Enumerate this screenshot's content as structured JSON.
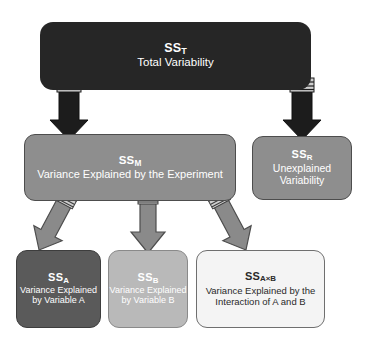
{
  "diagram": {
    "background_color": "#ffffff",
    "nodes": {
      "total": {
        "symbol": "SS",
        "subscript": "T",
        "label": "Total Variability",
        "fill_color": "#262626",
        "text_color": "#ffffff"
      },
      "model": {
        "symbol": "SS",
        "subscript": "M",
        "label": "Variance Explained by the Experiment",
        "fill_color": "#8e8e8e",
        "text_color": "#ffffff"
      },
      "residual": {
        "symbol": "SS",
        "subscript": "R",
        "label": "Unexplained Variability",
        "fill_color": "#8e8e8e",
        "text_color": "#ffffff"
      },
      "factor_a": {
        "symbol": "SS",
        "subscript": "A",
        "label": "Variance Explained by Variable A",
        "fill_color": "#5a5a5a",
        "text_color": "#ffffff"
      },
      "factor_b": {
        "symbol": "SS",
        "subscript": "B",
        "label": "Variance Explained by Variable B",
        "fill_color": "#b9b9b9",
        "text_color": "#ffffff"
      },
      "interaction": {
        "symbol": "SS",
        "subscript": "A×B",
        "label": "Variance Explained by the Interaction of A and B",
        "fill_color": "#f4f4f4",
        "text_color": "#2a2a2a"
      }
    },
    "arrows": [
      {
        "name": "total-to-model",
        "from": "total",
        "to": "model",
        "color": "#1c1c1c",
        "direction": "down"
      },
      {
        "name": "total-to-residual",
        "from": "total",
        "to": "residual",
        "color": "#1c1c1c",
        "direction": "down"
      },
      {
        "name": "model-to-factor-a",
        "from": "model",
        "to": "factor_a",
        "color": "#8a8a8a",
        "direction": "down-left"
      },
      {
        "name": "model-to-factor-b",
        "from": "model",
        "to": "factor_b",
        "color": "#8a8a8a",
        "direction": "down"
      },
      {
        "name": "model-to-interaction",
        "from": "model",
        "to": "interaction",
        "color": "#8a8a8a",
        "direction": "down-right"
      }
    ]
  }
}
